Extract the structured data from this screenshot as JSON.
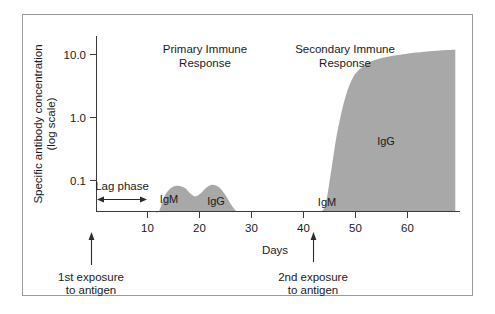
{
  "figure": {
    "type": "immune-response-chart",
    "background_color": "#ffffff",
    "frame_color": "#9a9a9a",
    "fill_color": "#a8a8a8",
    "axis_color": "#3a3a3a"
  },
  "chart_data": {
    "type": "area",
    "title": "",
    "xlabel": "Days",
    "ylabel": "Specific antibody concentration (log scale)",
    "ylabel_line1": "Specific antibody concentration",
    "ylabel_line2": "(log scale)",
    "xlim": [
      0,
      69
    ],
    "ylim_log": [
      0.01,
      20.0
    ],
    "grid": false,
    "legend": "none",
    "x_ticks": [
      10,
      20,
      30,
      40,
      50,
      60
    ],
    "x_tick_labels": [
      "10",
      "20",
      "30",
      "40",
      "50",
      "60"
    ],
    "y_ticks": [
      0.1,
      1.0,
      10.0
    ],
    "y_tick_labels": [
      "0.1",
      "1.0",
      "10.0"
    ],
    "series": [
      {
        "name": "Specific antibody concentration",
        "fill": "#a8a8a8",
        "points_x": [
          0,
          10,
          11,
          12,
          13,
          14,
          15,
          16,
          17,
          18,
          19,
          20,
          21,
          22,
          23,
          24,
          25,
          26,
          27,
          28,
          30,
          33,
          36,
          40,
          42,
          43,
          44,
          45,
          46,
          47,
          48,
          49,
          50,
          52,
          54,
          56,
          58,
          60,
          63,
          66,
          69
        ],
        "points_y": [
          0.0,
          0.0,
          0.012,
          0.03,
          0.055,
          0.072,
          0.081,
          0.082,
          0.076,
          0.063,
          0.056,
          0.062,
          0.075,
          0.085,
          0.083,
          0.072,
          0.055,
          0.04,
          0.03,
          0.024,
          0.018,
          0.015,
          0.014,
          0.014,
          0.016,
          0.022,
          0.04,
          0.12,
          0.42,
          1.1,
          2.3,
          3.8,
          5.2,
          7.2,
          8.4,
          9.2,
          9.8,
          10.4,
          11.1,
          11.6,
          11.9
        ]
      }
    ],
    "annotations": [
      {
        "name": "primary-response-title",
        "text": "Primary Immune\nResponse",
        "line1": "Primary Immune",
        "line2": "Response",
        "x_day": 21,
        "y_value": 14.0
      },
      {
        "name": "secondary-response-title",
        "text": "Secondary Immune\nResponse",
        "line1": "Secondary Immune",
        "line2": "Response",
        "x_day": 50,
        "y_value": 14.0
      },
      {
        "name": "igm-primary-label",
        "text": "IgM",
        "x_day": 15.5,
        "y_value": 0.055
      },
      {
        "name": "igg-primary-label",
        "text": "IgG",
        "x_day": 22.5,
        "y_value": 0.05
      },
      {
        "name": "igm-secondary-label",
        "text": "IgM",
        "x_day": 44.5,
        "y_value": 0.04
      },
      {
        "name": "igg-secondary-label",
        "text": "IgG",
        "x_day": 56,
        "y_value": 1.6
      },
      {
        "name": "lag-phase-label",
        "text": "Lag phase",
        "x_day": 5,
        "y_value": 0.072
      }
    ],
    "markers": [
      {
        "name": "lag-phase-range",
        "type": "double-arrow",
        "from_day": 0,
        "to_day": 10,
        "label": "Lag phase"
      },
      {
        "name": "first-exposure-marker",
        "type": "up-arrow",
        "x_day": -1,
        "label_line1": "1st exposure",
        "label_line2": "to antigen"
      },
      {
        "name": "second-exposure-marker",
        "type": "up-arrow",
        "x_day": 42,
        "label_line1": "2nd exposure",
        "label_line2": "to antigen"
      }
    ]
  },
  "labels": {
    "y_axis_line1": "Specific antibody concentration",
    "y_axis_line2": "(log scale)",
    "x_axis": "Days",
    "y_10": "10.0",
    "y_1": "1.0",
    "y_01": "0.1",
    "x_10": "10",
    "x_20": "20",
    "x_30": "30",
    "x_40": "40",
    "x_50": "50",
    "x_60": "60",
    "primary_title_l1": "Primary Immune",
    "primary_title_l2": "Response",
    "secondary_title_l1": "Secondary Immune",
    "secondary_title_l2": "Response",
    "igm_primary": "IgM",
    "igg_primary": "IgG",
    "igm_secondary": "IgM",
    "igg_secondary": "IgG",
    "lag_phase": "Lag phase",
    "first_exposure_l1": "1st exposure",
    "first_exposure_l2": "to antigen",
    "second_exposure_l1": "2nd exposure",
    "second_exposure_l2": "to antigen"
  }
}
